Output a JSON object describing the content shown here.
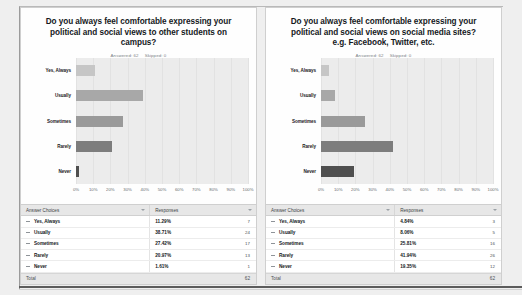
{
  "panels": [
    {
      "title": "Do you always feel comfortable expressing your political and social views to other students on campus?",
      "answered_label": "Answered: 62",
      "skipped_label": "Skipped: 0",
      "table": {
        "col_answer": "Answer Choices",
        "col_responses": "Responses",
        "total_label": "Total",
        "total_value": "62"
      },
      "chart_data": {
        "type": "bar",
        "orientation": "horizontal",
        "title": "Do you always feel comfortable expressing your political and social views to other students on campus?",
        "categories": [
          "Yes, Always",
          "Usually",
          "Sometimes",
          "Rarely",
          "Never"
        ],
        "values": [
          11.29,
          38.71,
          27.42,
          20.97,
          1.61
        ],
        "counts": [
          7,
          24,
          17,
          13,
          1
        ],
        "value_labels": [
          "11.29%",
          "38.71%",
          "27.42%",
          "20.97%",
          "1.61%"
        ],
        "count_labels": [
          "7",
          "24",
          "17",
          "13",
          "1"
        ],
        "colors": [
          "#c6c6c6",
          "#a8a8a8",
          "#9a9a9a",
          "#7d7d7d",
          "#4f4f4f"
        ],
        "xlabel": "",
        "ylabel": "",
        "xlim": [
          0,
          100
        ],
        "xticks": [
          "0%",
          "10%",
          "20%",
          "30%",
          "40%",
          "50%",
          "60%",
          "70%",
          "80%",
          "90%",
          "100%"
        ],
        "grid": true,
        "legend": "none",
        "total": 62
      }
    },
    {
      "title": "Do you always feel comfortable expressing your political and social views on social media sites? e.g. Facebook, Twitter, etc.",
      "answered_label": "Answered: 62",
      "skipped_label": "Skipped: 0",
      "table": {
        "col_answer": "Answer Choices",
        "col_responses": "Responses",
        "total_label": "Total",
        "total_value": "62"
      },
      "chart_data": {
        "type": "bar",
        "orientation": "horizontal",
        "title": "Do you always feel comfortable expressing your political and social views on social media sites? e.g. Facebook, Twitter, etc.",
        "categories": [
          "Yes, Always",
          "Usually",
          "Sometimes",
          "Rarely",
          "Never"
        ],
        "values": [
          4.84,
          8.06,
          25.81,
          41.94,
          19.35
        ],
        "counts": [
          3,
          5,
          16,
          26,
          12
        ],
        "value_labels": [
          "4.84%",
          "8.06%",
          "25.81%",
          "41.94%",
          "19.35%"
        ],
        "count_labels": [
          "3",
          "5",
          "16",
          "26",
          "12"
        ],
        "colors": [
          "#c6c6c6",
          "#a8a8a8",
          "#9a9a9a",
          "#7d7d7d",
          "#4f4f4f"
        ],
        "xlabel": "",
        "ylabel": "",
        "xlim": [
          0,
          100
        ],
        "xticks": [
          "0%",
          "10%",
          "20%",
          "30%",
          "40%",
          "50%",
          "60%",
          "70%",
          "80%",
          "90%",
          "100%"
        ],
        "grid": true,
        "legend": "none",
        "total": 62
      }
    }
  ]
}
